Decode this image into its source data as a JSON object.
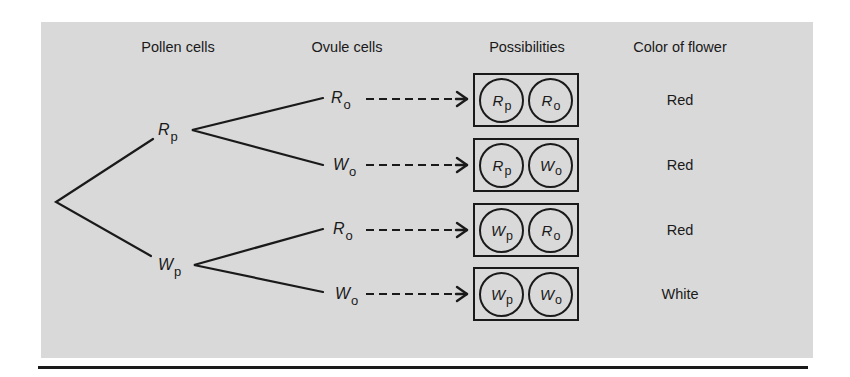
{
  "headers": {
    "pollen": "Pollen cells",
    "ovule": "Ovule cells",
    "possibilities": "Possibilities",
    "color": "Color of flower"
  },
  "pollen_nodes": [
    {
      "letter": "R",
      "sub": "p"
    },
    {
      "letter": "W",
      "sub": "p"
    }
  ],
  "ovule_nodes": [
    {
      "letter": "R",
      "sub": "o"
    },
    {
      "letter": "W",
      "sub": "o"
    },
    {
      "letter": "R",
      "sub": "o"
    },
    {
      "letter": "W",
      "sub": "o"
    }
  ],
  "possibilities": [
    {
      "a": {
        "letter": "R",
        "sub": "p"
      },
      "b": {
        "letter": "R",
        "sub": "o"
      },
      "color": "Red"
    },
    {
      "a": {
        "letter": "R",
        "sub": "p"
      },
      "b": {
        "letter": "W",
        "sub": "o"
      },
      "color": "Red"
    },
    {
      "a": {
        "letter": "W",
        "sub": "p"
      },
      "b": {
        "letter": "R",
        "sub": "o"
      },
      "color": "Red"
    },
    {
      "a": {
        "letter": "W",
        "sub": "p"
      },
      "b": {
        "letter": "W",
        "sub": "o"
      },
      "color": "White"
    }
  ],
  "colors": {
    "panel_bg": "#d9d9d9",
    "ink": "#1a1a1a"
  }
}
